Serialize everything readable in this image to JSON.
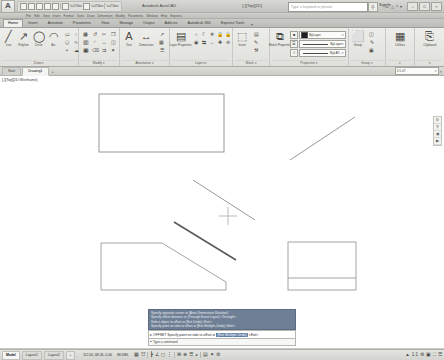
{
  "titlebar": {
    "logo": "A",
    "app_title": "Autodesk AutoCAD",
    "document_title": "[-][Top][2D]",
    "quick_access": [
      "new-icon",
      "open-icon",
      "save-icon",
      "saveas-icon",
      "print-icon",
      "undo-icon",
      "redo-icon"
    ],
    "search_placeholder": "Type a keyword or phrase",
    "search_icon": "search-icon",
    "help_icon": "help-icon",
    "signin_label": "Sign In",
    "right_icons": [
      "exchange-icon",
      "bell-icon",
      "help-icon",
      "caret-down-icon"
    ],
    "window_buttons": [
      "minimize-icon",
      "maximize-icon",
      "close-icon"
    ]
  },
  "menustrip": {
    "items": [
      "File",
      "Edit",
      "View",
      "Insert",
      "Format",
      "Tools",
      "Draw",
      "Dimension",
      "Modify",
      "Parametric",
      "Window",
      "Help",
      "Express"
    ]
  },
  "ribbon_tabs": {
    "items": [
      {
        "label": "Home",
        "active": true
      },
      {
        "label": "Insert",
        "active": false
      },
      {
        "label": "Annotate",
        "active": false
      },
      {
        "label": "Parametric",
        "active": false
      },
      {
        "label": "View",
        "active": false
      },
      {
        "label": "Manage",
        "active": false
      },
      {
        "label": "Output",
        "active": false
      },
      {
        "label": "Add-ins",
        "active": false
      },
      {
        "label": "Autodesk 360",
        "active": false
      },
      {
        "label": "Express Tools",
        "active": false
      }
    ],
    "overflow": "▾"
  },
  "ribbon": {
    "panels": [
      {
        "name": "draw",
        "title": "Draw ▾",
        "big_buttons": [
          {
            "label": "Line",
            "icon": "line-icon",
            "glyph": "╱"
          },
          {
            "label": "Polyline",
            "icon": "polyline-icon",
            "glyph": "↗"
          },
          {
            "label": "Circle",
            "icon": "circle-icon",
            "glyph": "◯"
          },
          {
            "label": "Arc",
            "icon": "arc-icon",
            "glyph": "◠"
          }
        ],
        "small_buttons": [
          "rectangle-icon",
          "ellipse-icon",
          "hatch-icon",
          "polygon-icon",
          "spline-icon",
          "gradient-icon",
          "point-icon",
          "revcloud-icon",
          "region-icon"
        ]
      },
      {
        "name": "modify",
        "title": "Modify ▾",
        "small_buttons": [
          "move-icon",
          "rotate-icon",
          "trim-icon",
          "copy-icon",
          "mirror-icon",
          "fillet-icon",
          "stretch-icon",
          "scale-icon",
          "array-icon",
          "erase-icon",
          "offset-icon",
          "explode-icon"
        ]
      },
      {
        "name": "annotation",
        "title": "Annotation ▾",
        "big_buttons": [
          {
            "label": "Text",
            "icon": "text-icon",
            "glyph": "A"
          },
          {
            "label": "Dimension",
            "icon": "dimension-icon",
            "glyph": "↔"
          }
        ],
        "small_buttons": [
          "leader-icon",
          "table-icon",
          "mtext-icon",
          "dimstyle-icon",
          "textstyle-icon",
          "tablestyle-icon"
        ]
      },
      {
        "name": "layers",
        "title": "Layers ▾",
        "big_buttons": [
          {
            "label": "Layer Properties",
            "icon": "layer-properties-icon",
            "glyph": "▤"
          }
        ],
        "small_buttons": [
          "layer-on-icon",
          "layer-off-icon",
          "layer-freeze-icon",
          "layer-lock-icon",
          "layer-unlock-icon",
          "layer-iso-icon",
          "layer-match-icon",
          "layer-prev-icon",
          "layer-make-icon",
          "layer-merge-icon",
          "layer-del-icon",
          "layer-walk-icon"
        ],
        "current_layer": "0"
      },
      {
        "name": "block",
        "title": "Block ▾",
        "big_buttons": [
          {
            "label": "Insert",
            "icon": "insert-block-icon",
            "glyph": "⬚"
          }
        ],
        "small_buttons": [
          "create-block-icon",
          "edit-block-icon",
          "block-attr-icon",
          "block-sync-icon"
        ]
      },
      {
        "name": "properties",
        "title": "Properties ▾",
        "big_buttons": [
          {
            "label": "Match Properties",
            "icon": "match-properties-icon",
            "glyph": "⧉"
          }
        ],
        "small_buttons": [
          "proplist-icon",
          "propgrid-icon",
          "proptrans-icon"
        ],
        "dropdowns": [
          {
            "name": "color",
            "icon": "color-swatch",
            "label": "ByLayer",
            "swatch": "#1f1f1f"
          },
          {
            "name": "lineweight",
            "icon": "lineweight-icon",
            "label": "ByLayer"
          },
          {
            "name": "linetype",
            "icon": "linetype-icon",
            "label": "ByLAY..."
          }
        ]
      },
      {
        "name": "group",
        "title": "Group ▾",
        "big_buttons": [
          {
            "label": "Group",
            "icon": "group-icon",
            "glyph": "⬜"
          }
        ],
        "small_buttons": [
          "ungroup-icon",
          "groupedit-icon",
          "groupselect-icon"
        ]
      },
      {
        "name": "utilities",
        "title": "▾",
        "big_buttons": [
          {
            "label": "Utilities",
            "icon": "utilities-icon",
            "glyph": "▦"
          }
        ]
      },
      {
        "name": "clipboard",
        "title": "▾",
        "big_buttons": [
          {
            "label": "Clipboard",
            "icon": "clipboard-icon",
            "glyph": "⎘"
          }
        ]
      }
    ]
  },
  "filetabs": {
    "tabs": [
      {
        "label": "Start",
        "active": false
      },
      {
        "label": "Drawing1",
        "active": true
      }
    ],
    "plus": "+",
    "viewport_scale": "2:1.07",
    "scale_caret": "▾",
    "close_x": "×"
  },
  "canvas": {
    "viewport_label": "[-][Top][2D Wireframe]",
    "nav_bar_icons": [
      "pan-icon",
      "zoom-icon",
      "orbit-icon",
      "showmotion-icon"
    ],
    "crosshair": {
      "x": 228,
      "y": 226
    },
    "shapes": [
      {
        "name": "rectangle-large",
        "type": "rect",
        "x": 99,
        "y": 104,
        "w": 125,
        "h": 58
      },
      {
        "name": "line-diagonal-upper-right",
        "type": "line",
        "x1": 290,
        "y1": 170,
        "x2": 355,
        "y2": 127
      },
      {
        "name": "line-diagonal-middle",
        "type": "line",
        "x1": 193,
        "y1": 190,
        "x2": 255,
        "y2": 230
      },
      {
        "name": "line-diagonal-thick",
        "type": "line",
        "x1": 174,
        "y1": 232,
        "x2": 236,
        "y2": 270
      },
      {
        "name": "polygon-chamfered",
        "type": "polygon",
        "points": "101,253 162,253 226,292 226,300 101,300"
      },
      {
        "name": "rectangle-right",
        "type": "rect",
        "x": 288,
        "y": 252,
        "w": 68,
        "h": 48
      },
      {
        "name": "line-divider-right",
        "type": "line",
        "x1": 288,
        "y1": 288,
        "x2": 356,
        "y2": 288
      }
    ]
  },
  "command_line": {
    "history": [
      "Specify opposite corner or [Area Dimensions Rotation]:",
      "Specify offset distance or [Through Erase Layer] <Through>:",
      "Select object to offset or [Exit Undo] <Exit>:",
      "Specify point on side to offset or [Exit Multiple Undo] <Exit>:"
    ],
    "prompt_icon": "command-icon",
    "prompt_text": "OFFSET Specify point on side to offset or",
    "prompt_options": "[Exit Multiple Undo]",
    "prompt_default": "<Exit>",
    "input_placeholder": "Type a command",
    "expand_icon": "chevron-up-icon"
  },
  "statusbar": {
    "layout_tabs": [
      {
        "label": "Model",
        "active": true
      },
      {
        "label": "Layout1",
        "active": false
      },
      {
        "label": "Layout2",
        "active": false
      }
    ],
    "add_layout": "+",
    "coordinates": "112.00, 68.26, 0.00",
    "model_label": "MODEL",
    "toggle_icons": [
      "grid-icon",
      "snap-icon",
      "ortho-icon",
      "polar-icon",
      "osnap-icon",
      "otrack-icon",
      "ducs-icon",
      "dyn-icon",
      "lwt-icon",
      "transparency-icon",
      "qp-icon",
      "sc-icon",
      "am-icon"
    ],
    "right_icons": [
      "annotation-scale-icon",
      "workspace-icon",
      "hardware-icon",
      "fullscreen-icon",
      "customize-icon"
    ],
    "annotation_scale": "1:1"
  }
}
